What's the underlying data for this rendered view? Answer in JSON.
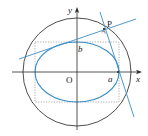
{
  "diagram": {
    "type": "geometry",
    "labels": {
      "y_axis": "y",
      "x_axis": "x",
      "origin": "O",
      "semi_minor": "b",
      "semi_major": "a",
      "point": "P"
    },
    "colors": {
      "axes": "#2a2a2a",
      "circle": "#3a3a3a",
      "ellipse": "#3a8ec8",
      "tangent_lines": "#3a8ec8",
      "dotted_rect": "#8a8a8a",
      "text": "#222222"
    },
    "geometry": {
      "origin": [
        77,
        72
      ],
      "circle_radius": 54,
      "ellipse_a": 42,
      "ellipse_b": 30,
      "point_P": [
        104,
        29
      ]
    }
  }
}
